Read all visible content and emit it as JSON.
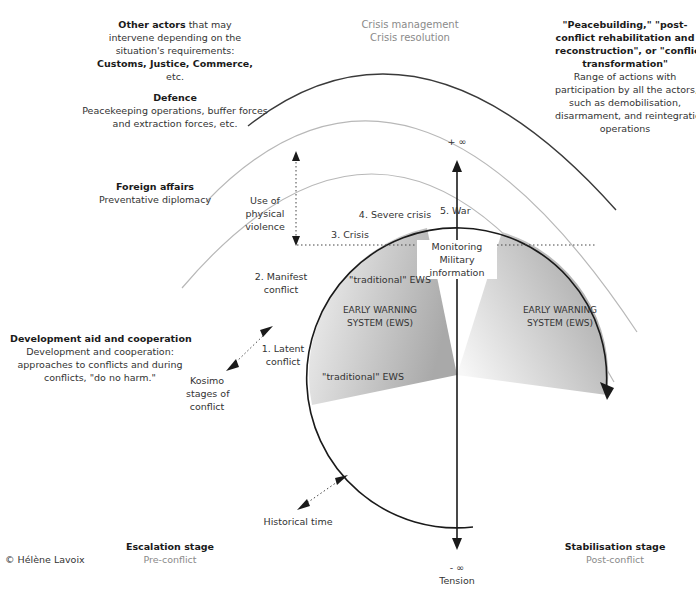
{
  "title_top": {
    "line1": "Crisis management",
    "line2": "Crisis resolution"
  },
  "actors": {
    "other": {
      "heading": "Other actors",
      "heading_suffix": "that may",
      "lines": [
        "intervene depending on the",
        "situation's requirements:"
      ],
      "bold_line": "Customs, Justice, Commerce,",
      "last_line": "etc."
    },
    "defence": {
      "heading": "Defence",
      "lines": [
        "Peacekeeping operations, buffer forces",
        "and extraction forces, etc."
      ]
    },
    "foreign": {
      "heading": "Foreign affairs",
      "lines": [
        "Preventative diplomacy"
      ]
    },
    "development": {
      "heading": "Development aid and cooperation",
      "lines": [
        "Development and cooperation:",
        "approaches to conflicts and during",
        "conflicts, \"do no harm.\""
      ]
    },
    "peacebuilding": {
      "heading_lines": [
        "\"Peacebuilding,\" \"post-",
        "conflict rehabilitation and",
        "reconstruction\", or \"conflict",
        "transformation\""
      ],
      "lines": [
        "Range of actions with",
        "participation by all the actors,",
        "such as demobilisation,",
        "disarmament, and reintegration",
        "operations"
      ]
    }
  },
  "axis": {
    "plus_infinity": "+ ∞",
    "minus_infinity": "- ∞",
    "tension": "Tension"
  },
  "stages": {
    "war": "5. War",
    "severe_crisis": "4. Severe crisis",
    "crisis": "3. Crisis",
    "manifest_line1": "2. Manifest",
    "manifest_line2": "conflict",
    "latent_line1": "1. Latent",
    "latent_line2": "conflict"
  },
  "labels": {
    "violence": [
      "Use of",
      "physical",
      "violence"
    ],
    "monitoring": [
      "Monitoring",
      "Military",
      "information"
    ],
    "traditional_ews": "\"traditional\" EWS",
    "ews_left": [
      "EARLY WARNING",
      "SYSTEM (EWS)"
    ],
    "ews_right": [
      "EARLY WARNING",
      "SYSTEM (EWS)"
    ],
    "kosimo": [
      "Kosimo",
      "stages of",
      "conflict"
    ],
    "historical_time": "Historical time"
  },
  "bottom": {
    "escalation": {
      "heading": "Escalation stage",
      "sub": "Pre-conflict"
    },
    "stabilisation": {
      "heading": "Stabilisation stage",
      "sub": "Post-conflict"
    },
    "copyright": "© Hélène Lavoix"
  },
  "colors": {
    "dark_line": "#2a2a2a",
    "grey_arc": "#b5b5b5",
    "grey_text": "#8a8a8a",
    "sector_fill_dark": "#a8a8a8",
    "sector_fill_light": "#f2f2f2"
  }
}
